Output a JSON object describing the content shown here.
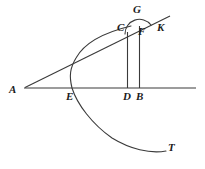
{
  "figure": {
    "kind": "geometry-diagram",
    "width": 205,
    "height": 169,
    "background_color": "#ffffff",
    "stroke_color": "#3a3a3a",
    "label_color": "#1b1b1b",
    "labels": [
      {
        "id": "A",
        "text": "A",
        "x": 9,
        "y": 84
      },
      {
        "id": "E",
        "text": "E",
        "x": 66,
        "y": 91
      },
      {
        "id": "D",
        "text": "D",
        "x": 123,
        "y": 91
      },
      {
        "id": "B",
        "text": "B",
        "x": 136,
        "y": 91
      },
      {
        "id": "C",
        "text": "C",
        "x": 117,
        "y": 22
      },
      {
        "id": "F",
        "text": "F",
        "x": 138,
        "y": 26
      },
      {
        "id": "G",
        "text": "G",
        "x": 133,
        "y": 4
      },
      {
        "id": "K",
        "text": "K",
        "x": 157,
        "y": 22
      },
      {
        "id": "T",
        "text": "T",
        "x": 168,
        "y": 142
      }
    ],
    "elements": [
      {
        "id": "baseline",
        "name": "horizontal-axis-line",
        "type": "line"
      },
      {
        "id": "secant",
        "name": "line-a-to-k",
        "type": "line"
      },
      {
        "id": "parabola",
        "name": "parabola-curve-e-to-t",
        "type": "curve"
      },
      {
        "id": "vertical-d",
        "name": "vertical-segment-c-to-d",
        "type": "line"
      },
      {
        "id": "vertical-b",
        "name": "vertical-segment-f-to-b",
        "type": "line"
      },
      {
        "id": "arc-cgk",
        "name": "circular-arc-c-g",
        "type": "arc"
      }
    ]
  }
}
